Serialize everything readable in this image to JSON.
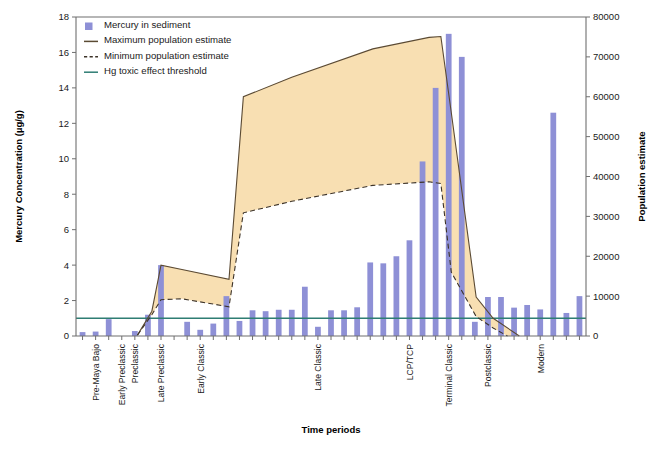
{
  "chart_data": {
    "type": "bar",
    "title": "",
    "xlabel": "Time periods",
    "ylabel": "Mercury Concentration (µg/g)",
    "y2label": "Population estimate",
    "ylim": [
      0,
      18
    ],
    "ylim_right": [
      0,
      80000
    ],
    "yticks": [
      0,
      2,
      4,
      6,
      8,
      10,
      12,
      14,
      16,
      18
    ],
    "yticks_right": [
      0,
      10000,
      20000,
      30000,
      40000,
      50000,
      60000,
      70000,
      80000
    ],
    "grid": false,
    "legend_position": "top-left",
    "legend": [
      {
        "label": "Mercury in sediment",
        "marker": "square",
        "color": "#8e90d6"
      },
      {
        "label": "Maximum population estimate",
        "marker": "line",
        "color": "#5b4a33"
      },
      {
        "label": "Minimum population estimate",
        "marker": "dashed-line",
        "color": "#3d3328"
      },
      {
        "label": "Hg toxic effect threshold",
        "marker": "line",
        "color": "#2e7d73"
      }
    ],
    "category_labels": [
      {
        "index": 1,
        "text": "Pre-Maya Bajo"
      },
      {
        "index": 3,
        "text": "Early Preclassic"
      },
      {
        "index": 4,
        "text": "Preclassic"
      },
      {
        "index": 6,
        "text": "Late Preclassic"
      },
      {
        "index": 9,
        "text": "Early Classic"
      },
      {
        "index": 18,
        "text": "Late Classic"
      },
      {
        "index": 25,
        "text": "LCP/TCP"
      },
      {
        "index": 28,
        "text": "Terminal Classic"
      },
      {
        "index": 31,
        "text": "Postclassic"
      },
      {
        "index": 35,
        "text": "Modern"
      }
    ],
    "n_categories": 39,
    "values": [
      0.22,
      0.25,
      0.95,
      0.0,
      0.28,
      1.2,
      4.0,
      0.0,
      0.8,
      0.35,
      0.7,
      2.25,
      0.85,
      1.45,
      1.4,
      1.48,
      1.48,
      2.78,
      0.52,
      1.45,
      1.45,
      1.62,
      4.15,
      4.1,
      4.5,
      5.4,
      9.85,
      14.0,
      17.05,
      15.75,
      0.8,
      2.2,
      2.2,
      1.6,
      1.75,
      1.5,
      12.6,
      1.3,
      2.25
    ],
    "threshold_value": 1.0,
    "max_population_series": {
      "name": "Maximum population estimate",
      "points": [
        {
          "index": 4.2,
          "value": 0.05
        },
        {
          "index": 5.3,
          "value": 1.4
        },
        {
          "index": 6.0,
          "value": 4.0
        },
        {
          "index": 7.6,
          "value": 3.75
        },
        {
          "index": 11.2,
          "value": 3.2
        },
        {
          "index": 12.3,
          "value": 13.5
        },
        {
          "index": 16.0,
          "value": 14.6
        },
        {
          "index": 22.2,
          "value": 16.2
        },
        {
          "index": 26.5,
          "value": 16.85
        },
        {
          "index": 27.4,
          "value": 16.9
        },
        {
          "index": 28.2,
          "value": 12.6
        },
        {
          "index": 30.1,
          "value": 2.2
        },
        {
          "index": 31.4,
          "value": 1.0
        },
        {
          "index": 33.4,
          "value": 0.0
        }
      ]
    },
    "min_population_series": {
      "name": "Minimum population estimate",
      "points": [
        {
          "index": 4.2,
          "value": 0.05
        },
        {
          "index": 5.3,
          "value": 1.2
        },
        {
          "index": 6.0,
          "value": 2.05
        },
        {
          "index": 7.6,
          "value": 2.1
        },
        {
          "index": 11.2,
          "value": 1.65
        },
        {
          "index": 12.3,
          "value": 6.95
        },
        {
          "index": 16.0,
          "value": 7.6
        },
        {
          "index": 22.2,
          "value": 8.5
        },
        {
          "index": 26.5,
          "value": 8.7
        },
        {
          "index": 27.4,
          "value": 8.6
        },
        {
          "index": 28.2,
          "value": 3.6
        },
        {
          "index": 30.1,
          "value": 1.1
        },
        {
          "index": 31.4,
          "value": 0.45
        },
        {
          "index": 32.5,
          "value": 0.0
        }
      ]
    }
  }
}
